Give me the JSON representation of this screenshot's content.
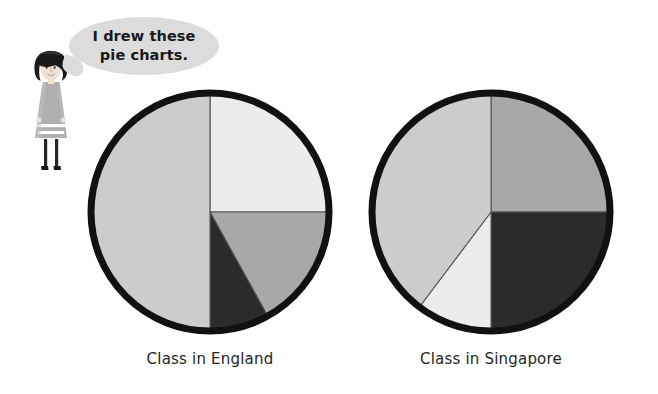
{
  "speech": {
    "line1": "I drew these",
    "line2": "pie charts.",
    "bubble_color": "#dcdcdc",
    "text_color": "#191919"
  },
  "character": {
    "name": "girl-illustration",
    "hair_color": "#1a1a1a",
    "skin_color": "#efe2d4",
    "dress_color": "#b0b0b0",
    "stripe_color": "#ffffff",
    "legs_color": "#262626"
  },
  "palette": {
    "outline": "#111111",
    "seg_light": "#ececec",
    "seg_lightgray": "#cccccc",
    "seg_medium": "#a8a8a8",
    "seg_dark": "#2b2b2b",
    "divider": "#555555",
    "background": "#ffffff"
  },
  "chart_data": [
    {
      "type": "pie",
      "title": "Class in England",
      "id": "england",
      "center": [
        123,
        124
      ],
      "radius": 119,
      "start_angle_deg": 0,
      "labels": [
        "Segment A",
        "Segment B",
        "Segment C",
        "Segment D"
      ],
      "values": [
        25,
        17,
        8,
        50
      ],
      "colors": [
        "#ececec",
        "#a8a8a8",
        "#2b2b2b",
        "#cccccc"
      ],
      "segments": [
        {
          "label": "Segment A",
          "value": 25,
          "start_deg": 0,
          "end_deg": 90,
          "color": "#ececec"
        },
        {
          "label": "Segment B",
          "value": 17,
          "start_deg": 90,
          "end_deg": 151,
          "color": "#a8a8a8"
        },
        {
          "label": "Segment C",
          "value": 8,
          "start_deg": 151,
          "end_deg": 180,
          "color": "#2b2b2b"
        },
        {
          "label": "Segment D",
          "value": 50,
          "start_deg": 180,
          "end_deg": 360,
          "color": "#cccccc"
        }
      ]
    },
    {
      "type": "pie",
      "title": "Class in Singapore",
      "id": "singapore",
      "center": [
        123,
        124
      ],
      "radius": 119,
      "start_angle_deg": 0,
      "labels": [
        "Segment A",
        "Segment B",
        "Segment C",
        "Segment D"
      ],
      "values": [
        25,
        25,
        10,
        40
      ],
      "colors": [
        "#a8a8a8",
        "#2b2b2b",
        "#ececec",
        "#cccccc"
      ],
      "segments": [
        {
          "label": "Segment A",
          "value": 25,
          "start_deg": 0,
          "end_deg": 90,
          "color": "#a8a8a8"
        },
        {
          "label": "Segment B",
          "value": 25,
          "start_deg": 90,
          "end_deg": 180,
          "color": "#2b2b2b"
        },
        {
          "label": "Segment C",
          "value": 10,
          "start_deg": 180,
          "end_deg": 217,
          "color": "#ececec"
        },
        {
          "label": "Segment D",
          "value": 40,
          "start_deg": 217,
          "end_deg": 360,
          "color": "#cccccc"
        }
      ]
    }
  ],
  "captions": {
    "england": "Class in England",
    "singapore": "Class in Singapore"
  }
}
